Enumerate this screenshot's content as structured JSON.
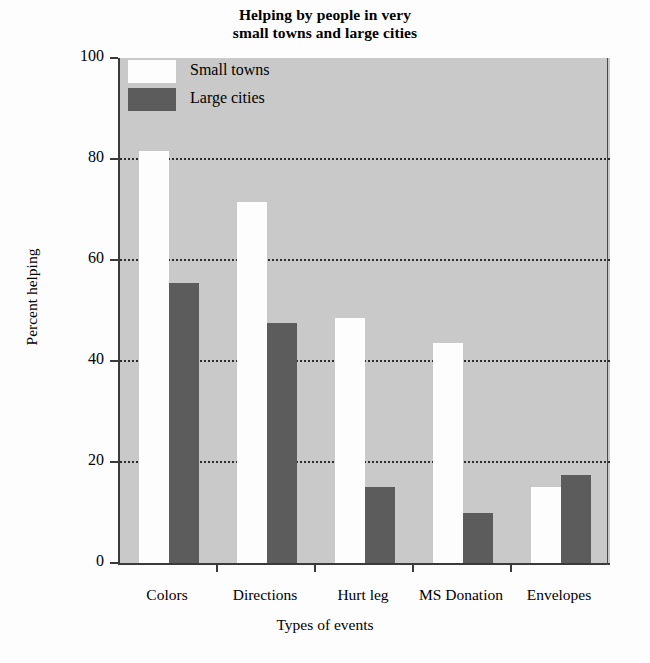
{
  "chart_data": {
    "type": "bar",
    "title": "Helping by people in very small towns and large cities",
    "title_line1": "Helping by people in very",
    "title_line2": "small towns and large cities",
    "xlabel": "Types of events",
    "ylabel": "Percent helping",
    "categories": [
      "Colors",
      "Directions",
      "Hurt leg",
      "MS Donation",
      "Envelopes"
    ],
    "series": [
      {
        "name": "Small towns",
        "color": "#fdfdfd",
        "values": [
          81.5,
          71.5,
          48.5,
          43.5,
          15
        ]
      },
      {
        "name": "Large cities",
        "color": "#5c5c5c",
        "values": [
          55.5,
          47.5,
          15,
          10,
          17.5
        ]
      }
    ],
    "ylim": [
      0,
      100
    ],
    "yticks": [
      "0",
      "20",
      "40",
      "60",
      "80",
      "100"
    ],
    "ytick_values": [
      0,
      20,
      40,
      60,
      80,
      100
    ],
    "gridlines": [
      20,
      40,
      60,
      80
    ],
    "grid": true,
    "legend_position": "upper-left-inside",
    "plot_background": "#c9c9c9"
  },
  "legend": {
    "items": [
      {
        "label": "Small towns",
        "swatch": "small-towns"
      },
      {
        "label": "Large cities",
        "swatch": "large-cities"
      }
    ]
  }
}
